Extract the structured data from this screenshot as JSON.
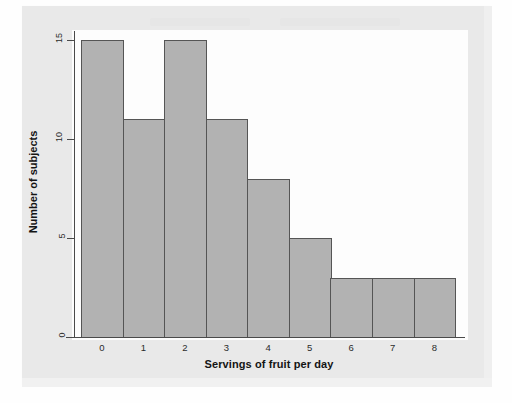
{
  "chart_data": {
    "type": "bar",
    "title": "",
    "xlabel": "Servings of fruit per day",
    "ylabel": "Number of subjects",
    "categories": [
      "0",
      "1",
      "2",
      "3",
      "4",
      "5",
      "6",
      "7",
      "8"
    ],
    "values": [
      15,
      11,
      15,
      11,
      8,
      5,
      3,
      3,
      3
    ],
    "ylim": [
      0,
      15.5
    ],
    "yticks": [
      "0",
      "5",
      "10",
      "15"
    ],
    "ytick_values": [
      0,
      5,
      10,
      15
    ],
    "grid": false,
    "legend": "none",
    "bar_fill_color": "#b2b2b2",
    "bar_edge_color": "#555555",
    "axis_color": "#4a4a4a",
    "panel_background": "#fdfdfd",
    "page_background": "#e9e9e9"
  },
  "axes": {
    "x_title": "Servings of fruit per day",
    "y_title": "Number of subjects"
  }
}
